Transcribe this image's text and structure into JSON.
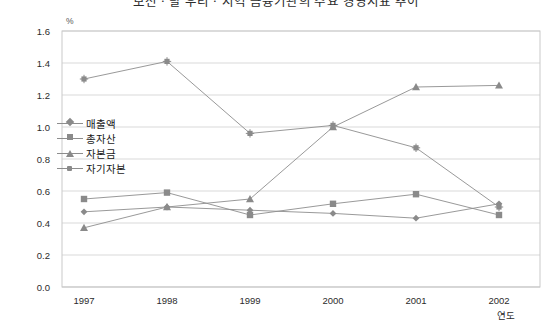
{
  "title": "보전ㆍ탈 우리ㆍ지역 금융기관의 주요 경영지표 추이",
  "unit_label": "%",
  "axis": {
    "y_title": "",
    "x_title": "연도",
    "y_ticks": [
      "1.6",
      "1.4",
      "1.2",
      "1.0",
      "0.8",
      "0.6",
      "0.4",
      "0.2",
      "0.0"
    ],
    "x_ticks": [
      "1997",
      "1998",
      "1999",
      "2000",
      "2001",
      "2002"
    ]
  },
  "legend": {
    "items": [
      {
        "label": "매출액",
        "marker": "diamond-marker",
        "color": "#8a8a8a"
      },
      {
        "label": "총자산",
        "marker": "square-marker",
        "color": "#8a8a8a"
      },
      {
        "label": "자본금",
        "marker": "triangle-marker",
        "color": "#8a8a8a"
      },
      {
        "label": "자기자본",
        "marker": "star-marker",
        "color": "#8a8a8a"
      }
    ]
  },
  "chart_data": {
    "type": "line",
    "title": "보전ㆍ탈 우리ㆍ지역 금융기관의 주요 경영지표 추이",
    "xlabel": "연도",
    "ylabel": "%",
    "ylim": [
      0.0,
      1.6
    ],
    "ytick_step": 0.2,
    "grid": true,
    "legend_position": "inside-left",
    "categories": [
      "1997",
      "1998",
      "1999",
      "2000",
      "2001",
      "2002"
    ],
    "series": [
      {
        "name": "매출액",
        "marker": "diamond",
        "color": "#8a8a8a",
        "values": [
          0.47,
          0.5,
          0.48,
          0.46,
          0.43,
          0.52
        ]
      },
      {
        "name": "총자산",
        "marker": "square",
        "color": "#8a8a8a",
        "values": [
          0.55,
          0.59,
          0.45,
          0.52,
          0.58,
          0.45
        ]
      },
      {
        "name": "자본금",
        "marker": "triangle",
        "color": "#8a8a8a",
        "values": [
          0.37,
          0.5,
          0.55,
          1.0,
          1.25,
          1.26
        ]
      },
      {
        "name": "자기자본",
        "marker": "star",
        "color": "#8a8a8a",
        "values": [
          1.3,
          1.41,
          0.96,
          1.01,
          0.87,
          0.5
        ]
      }
    ]
  },
  "style": {
    "plot_border": "#c9c9c9",
    "gridline": "#d9d9d9",
    "line_color": "#8d8d8d",
    "marker_color": "#8a8a8a",
    "text_color": "#1a1a1a"
  }
}
